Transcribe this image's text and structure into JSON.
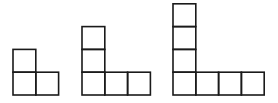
{
  "diagram": {
    "stroke_color": "#1a1a1a",
    "background": "#ffffff",
    "cell_size": 22.8,
    "figures": [
      {
        "label": "figure-1",
        "origin_x": 13,
        "base_y": 95,
        "vertical_cells": 2,
        "horizontal_cells": 2
      },
      {
        "label": "figure-2",
        "origin_x": 82,
        "base_y": 95,
        "vertical_cells": 3,
        "horizontal_cells": 3
      },
      {
        "label": "figure-3",
        "origin_x": 173,
        "base_y": 95,
        "vertical_cells": 4,
        "horizontal_cells": 4
      }
    ]
  }
}
